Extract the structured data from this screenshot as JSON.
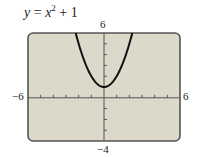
{
  "chart_data": {
    "type": "line",
    "title_parts": {
      "y": "y",
      "eq": " = ",
      "x": "x",
      "exp": "2",
      "rest": " + 1"
    },
    "xlabel": "",
    "ylabel": "",
    "xlim": [
      -6,
      6
    ],
    "ylim": [
      -4,
      6
    ],
    "x_tick_labels": {
      "min": "−6",
      "max": "6"
    },
    "y_tick_labels": {
      "min": "−4",
      "max": "6"
    },
    "x_tick_step": 1,
    "y_tick_step": 1,
    "grid": false,
    "series": [
      {
        "name": "y = x^2 + 1",
        "x": [
          -2.24,
          -2,
          -1.5,
          -1,
          -0.5,
          0,
          0.5,
          1,
          1.5,
          2,
          2.24
        ],
        "y": [
          6,
          5,
          3.25,
          2,
          1.25,
          1,
          1.25,
          2,
          3.25,
          5,
          6
        ]
      }
    ],
    "colors": {
      "background": "#dcd9cb",
      "frame": "#555555",
      "curve": "#111111",
      "axis": "#555555"
    }
  }
}
